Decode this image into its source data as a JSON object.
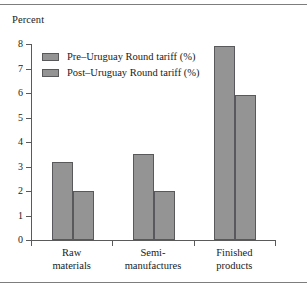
{
  "chart_data": {
    "type": "bar",
    "title": "",
    "subtitle": "",
    "xlabel": "",
    "ylabel": "Percent",
    "ylim": [
      0,
      8
    ],
    "ytick_labels": [
      "0",
      "1",
      "2",
      "3",
      "4",
      "5",
      "6",
      "7",
      "8"
    ],
    "ytick_values": [
      0,
      1,
      2,
      3,
      4,
      5,
      6,
      7,
      8
    ],
    "grid": false,
    "legend_position": "upper-left",
    "categories": [
      "Raw materials",
      "Semi-manufactures",
      "Finished products"
    ],
    "category_lines": [
      [
        "Raw",
        "materials"
      ],
      [
        "Semi-",
        "manufactures"
      ],
      [
        "Finished",
        "products"
      ]
    ],
    "series": [
      {
        "name": "Pre–Uruguay Round tariff (%)",
        "values": [
          3.2,
          3.5,
          7.9
        ],
        "color": "#949494"
      },
      {
        "name": "Post–Uruguay Round tariff (%)",
        "values": [
          2.0,
          2.0,
          5.9
        ],
        "color": "#949494"
      }
    ]
  },
  "colors": {
    "bar_fill": "#949494",
    "bar_edge": "#59595b",
    "axis": "#5a5a5a",
    "rule": "#7d7d7d",
    "text": "#1a1a1a",
    "background": "#ffffff"
  },
  "legend": {
    "items": [
      {
        "label": "Pre–Uruguay Round tariff (%)"
      },
      {
        "label": "Post–Uruguay Round tariff (%)"
      }
    ]
  },
  "axes": {
    "y_title": "Percent"
  }
}
